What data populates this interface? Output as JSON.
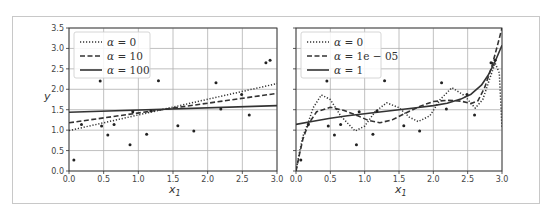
{
  "chart_data": [
    {
      "type": "scatter+line",
      "title": "",
      "xlabel": "x_1",
      "ylabel": "y",
      "xlim": [
        0.0,
        3.0
      ],
      "ylim": [
        0.0,
        3.5
      ],
      "grid": true,
      "xticks": [
        "0.0",
        "0.5",
        "1.0",
        "1.5",
        "2.0",
        "2.5",
        "3.0"
      ],
      "yticks": [
        "0.0",
        "0.5",
        "1.0",
        "1.5",
        "2.0",
        "2.5",
        "3.0",
        "3.5"
      ],
      "legend_position": "upper left",
      "scatter": {
        "x": [
          0.07,
          0.18,
          0.45,
          0.47,
          0.56,
          0.65,
          0.88,
          0.92,
          1.12,
          1.18,
          1.29,
          1.57,
          1.8,
          2.12,
          2.19,
          2.49,
          2.6,
          2.84,
          2.9
        ],
        "y": [
          0.27,
          1.14,
          2.2,
          1.1,
          0.88,
          1.14,
          0.64,
          1.45,
          0.9,
          1.47,
          2.21,
          1.11,
          0.98,
          2.16,
          1.52,
          1.87,
          1.37,
          2.65,
          2.71
        ]
      },
      "series": [
        {
          "name": "α = 0",
          "label_alpha": "α",
          "label_value": "0",
          "style": "dotted",
          "x": [
            0.0,
            3.0
          ],
          "y": [
            0.99,
            2.14
          ]
        },
        {
          "name": "α = 10",
          "label_alpha": "α",
          "label_value": "10",
          "style": "dashed",
          "x": [
            0.0,
            3.0
          ],
          "y": [
            1.18,
            1.9
          ]
        },
        {
          "name": "α = 100",
          "label_alpha": "α",
          "label_value": "100",
          "style": "solid",
          "x": [
            0.0,
            3.0
          ],
          "y": [
            1.44,
            1.6
          ]
        }
      ]
    },
    {
      "type": "scatter+line",
      "title": "",
      "xlabel": "x_1",
      "ylabel": "",
      "xlim": [
        0.0,
        3.0
      ],
      "ylim": [
        0.0,
        3.5
      ],
      "grid": true,
      "xticks": [
        "0.0",
        "0.5",
        "1.0",
        "1.5",
        "2.0",
        "2.5",
        "3.0"
      ],
      "yticks": [],
      "legend_position": "upper left",
      "scatter": {
        "x": [
          0.07,
          0.18,
          0.45,
          0.47,
          0.56,
          0.65,
          0.88,
          0.92,
          1.12,
          1.18,
          1.29,
          1.57,
          1.8,
          2.12,
          2.19,
          2.49,
          2.6,
          2.84,
          2.9
        ],
        "y": [
          0.27,
          1.14,
          2.2,
          1.1,
          0.88,
          1.14,
          0.64,
          1.45,
          0.9,
          1.47,
          2.21,
          1.11,
          0.98,
          2.16,
          1.52,
          1.87,
          1.37,
          2.65,
          2.71
        ]
      },
      "series": [
        {
          "name": "α = 0",
          "label_alpha": "α",
          "label_value": "0",
          "style": "dotted",
          "x": [
            0.0,
            0.05,
            0.1,
            0.18,
            0.25,
            0.37,
            0.5,
            0.65,
            0.86,
            1.0,
            1.15,
            1.32,
            1.5,
            1.65,
            1.78,
            1.95,
            2.1,
            2.27,
            2.45,
            2.61,
            2.72,
            2.82,
            2.9,
            2.96,
            3.0
          ],
          "y": [
            0.0,
            0.45,
            0.85,
            1.2,
            1.55,
            1.86,
            1.75,
            1.35,
            0.98,
            1.1,
            1.45,
            1.67,
            1.55,
            1.32,
            1.21,
            1.35,
            1.75,
            2.04,
            1.85,
            1.54,
            1.75,
            2.25,
            2.64,
            2.4,
            1.05
          ]
        },
        {
          "name": "α = 1e-05",
          "label_alpha": "α",
          "label_value": "1e − 05",
          "style": "dashed",
          "x": [
            0.0,
            0.05,
            0.1,
            0.18,
            0.3,
            0.5,
            0.7,
            0.9,
            1.05,
            1.22,
            1.4,
            1.6,
            1.8,
            2.0,
            2.2,
            2.4,
            2.55,
            2.65,
            2.75,
            2.85,
            2.93,
            3.0
          ],
          "y": [
            0.0,
            0.4,
            0.78,
            1.15,
            1.45,
            1.56,
            1.48,
            1.35,
            1.24,
            1.18,
            1.25,
            1.42,
            1.58,
            1.7,
            1.73,
            1.71,
            1.65,
            1.72,
            2.05,
            2.55,
            3.05,
            3.5
          ]
        },
        {
          "name": "α = 1",
          "label_alpha": "α",
          "label_value": "1",
          "style": "solid",
          "x": [
            0.0,
            0.25,
            0.5,
            0.75,
            1.0,
            1.25,
            1.5,
            1.75,
            2.0,
            2.2,
            2.4,
            2.55,
            2.7,
            2.8,
            2.9,
            3.0
          ],
          "y": [
            1.14,
            1.22,
            1.29,
            1.35,
            1.4,
            1.45,
            1.5,
            1.55,
            1.6,
            1.66,
            1.76,
            1.88,
            2.1,
            2.35,
            2.68,
            3.08
          ]
        }
      ]
    }
  ],
  "panels": [
    {
      "ylabel": "y",
      "xlabel": "x",
      "xlabel_sub": "1"
    },
    {
      "ylabel": "",
      "xlabel": "x",
      "xlabel_sub": "1"
    }
  ],
  "colors": {
    "curve": "#333333",
    "points": "#222222",
    "grid": "#b0b0b0",
    "frame": "#c8c8c8"
  }
}
